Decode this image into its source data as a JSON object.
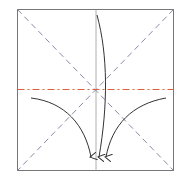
{
  "diagram": {
    "type": "origami-fold-diagram",
    "square": {
      "x": 17.5,
      "y": 9.5,
      "size": 156,
      "stroke": "#777777"
    },
    "center": {
      "x": 96,
      "y": 89
    },
    "lines": {
      "diagonal_valley_color": "#8a8aa8",
      "horizontal_mountain_color": "#e0603a",
      "vertical_crease_color": "#999999"
    },
    "arrows": {
      "color": "#333333",
      "items": [
        {
          "name": "left-arrow",
          "direction": "curve-down-right"
        },
        {
          "name": "center-arrow",
          "direction": "curve-down"
        },
        {
          "name": "right-arrow",
          "direction": "curve-down-left"
        }
      ]
    }
  }
}
